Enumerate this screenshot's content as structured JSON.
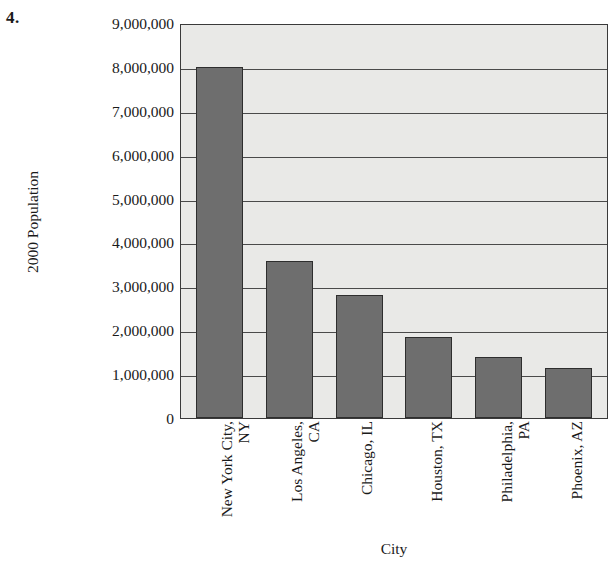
{
  "item_number": "4.",
  "top_clipped_caption": "",
  "chart_data": {
    "type": "bar",
    "title": "",
    "xlabel": "City",
    "ylabel": "2000 Population",
    "categories": [
      "New York City, NY",
      "Los Angeles, CA",
      "Chicago, IL",
      "Houston, TX",
      "Philadelphia, PA",
      "Phoenix, AZ"
    ],
    "category_lines": [
      [
        "New York City,",
        "NY"
      ],
      [
        "Los Angeles,",
        "CA"
      ],
      [
        "Chicago, IL"
      ],
      [
        "Houston, TX"
      ],
      [
        "Philadelphia,",
        "PA"
      ],
      [
        "Phoenix, AZ"
      ]
    ],
    "values": [
      8000000,
      3580000,
      2800000,
      1850000,
      1390000,
      1140000
    ],
    "ylim": [
      0,
      9000000
    ],
    "ytick_values": [
      9000000,
      8000000,
      7000000,
      6000000,
      5000000,
      4000000,
      3000000,
      2000000,
      1000000,
      0
    ],
    "ytick_labels": [
      "9,000,000",
      "8,000,000",
      "7,000,000",
      "6,000,000",
      "5,000,000",
      "4,000,000",
      "3,000,000",
      "2,000,000",
      "1,000,000",
      "0"
    ],
    "grid": true,
    "legend": false,
    "colors": {
      "bar_fill": "#6e6e6e",
      "bar_border": "#2e2e2e",
      "plot_background": "#e9e9e7",
      "gridline": "#4a4a4a",
      "axis_border": "#3a3a3a",
      "text": "#1a1a1a"
    }
  }
}
